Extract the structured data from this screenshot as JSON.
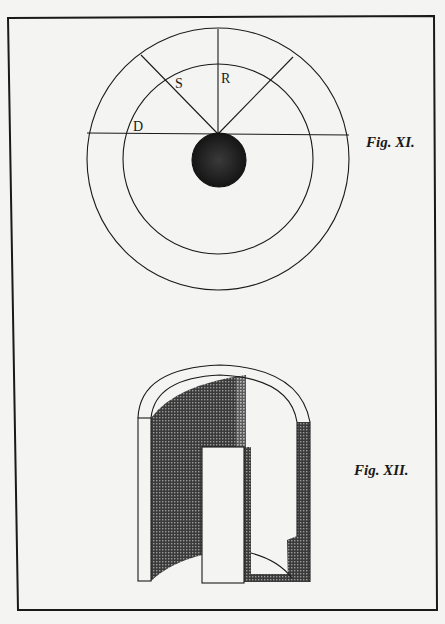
{
  "plate": {
    "background": "#f4f4f2",
    "ink": "#1a1a1a",
    "border": {
      "description": "hand-ruled plate border"
    }
  },
  "figure_11": {
    "caption": "Fig. XI.",
    "description": "Concentric circles with central dark sphere; radial lines labelled",
    "labels": {
      "S": "S",
      "R": "R",
      "D": "D"
    }
  },
  "figure_12": {
    "caption": "Fig. XII.",
    "description": "Cut-away view of arched vaulted chamber with doorway, shaded walls"
  }
}
